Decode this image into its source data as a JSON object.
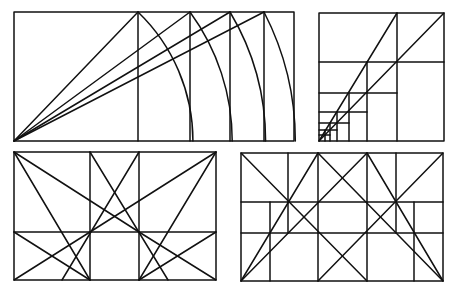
{
  "canvas": {
    "width": 458,
    "height": 285,
    "background": "#ffffff",
    "stroke": "#111111",
    "stroke_width": 1.5
  },
  "panels": [
    {
      "id": "root-rectangles",
      "name": "panel-root-rectangles",
      "frame": {
        "x1": 14,
        "y1": 12,
        "x2": 294,
        "y2": 141
      },
      "lines": [
        [
          138,
          12,
          138,
          141
        ],
        [
          190,
          12,
          190,
          141
        ],
        [
          230,
          12,
          230,
          141
        ],
        [
          264,
          12,
          264,
          141
        ],
        [
          14,
          141,
          138,
          12
        ],
        [
          14,
          141,
          190,
          12
        ],
        [
          14,
          141,
          230,
          12
        ],
        [
          14,
          141,
          264,
          12
        ]
      ],
      "arcs": [
        {
          "cx": 14,
          "cy": 141,
          "from": [
            138,
            12
          ],
          "to": [
            192,
            141
          ]
        },
        {
          "cx": 14,
          "cy": 141,
          "from": [
            190,
            12
          ],
          "to": [
            232,
            141
          ]
        },
        {
          "cx": 14,
          "cy": 141,
          "from": [
            230,
            12
          ],
          "to": [
            265,
            141
          ]
        },
        {
          "cx": 14,
          "cy": 141,
          "from": [
            264,
            12
          ],
          "to": [
            294,
            141
          ]
        }
      ]
    },
    {
      "id": "nested-squares",
      "name": "panel-nested-squares",
      "frame": {
        "x1": 319,
        "y1": 13,
        "x2": 444,
        "y2": 141
      },
      "lines": [
        [
          397,
          13,
          397,
          141
        ],
        [
          319,
          62,
          444,
          62
        ],
        [
          367,
          62,
          367,
          141
        ],
        [
          319,
          93,
          397,
          93
        ],
        [
          349,
          93,
          349,
          141
        ],
        [
          319,
          112,
          367,
          112
        ],
        [
          337,
          112,
          337,
          141
        ],
        [
          319,
          123,
          349,
          123
        ],
        [
          330,
          123,
          330,
          141
        ],
        [
          319,
          130,
          337,
          130
        ],
        [
          325,
          130,
          325,
          141
        ],
        [
          319,
          135,
          330,
          135
        ],
        [
          319,
          141,
          444,
          13
        ],
        [
          319,
          141,
          397,
          13
        ]
      ],
      "arcs": []
    },
    {
      "id": "diagonal-grid-left",
      "name": "panel-diagonal-grid-left",
      "frame": {
        "x1": 14,
        "y1": 152,
        "x2": 216,
        "y2": 280
      },
      "lines": [
        [
          90,
          152,
          90,
          280
        ],
        [
          139,
          152,
          139,
          280
        ],
        [
          14,
          232,
          216,
          232
        ],
        [
          14,
          152,
          139,
          232
        ],
        [
          14,
          152,
          90,
          280
        ],
        [
          216,
          152,
          90,
          232
        ],
        [
          216,
          152,
          139,
          280
        ],
        [
          90,
          152,
          168,
          280
        ],
        [
          139,
          152,
          62,
          280
        ],
        [
          14,
          232,
          90,
          280
        ],
        [
          14,
          280,
          90,
          232
        ],
        [
          216,
          232,
          139,
          280
        ],
        [
          216,
          280,
          139,
          232
        ]
      ],
      "arcs": []
    },
    {
      "id": "diagonal-grid-right",
      "name": "panel-diagonal-grid-right",
      "frame": {
        "x1": 241,
        "y1": 153,
        "x2": 443,
        "y2": 281
      },
      "lines": [
        [
          318,
          153,
          318,
          281
        ],
        [
          367,
          153,
          367,
          281
        ],
        [
          288,
          153,
          288,
          233
        ],
        [
          396,
          153,
          396,
          233
        ],
        [
          241,
          202,
          443,
          202
        ],
        [
          241,
          233,
          443,
          233
        ],
        [
          270,
          202,
          270,
          281
        ],
        [
          414,
          202,
          414,
          281
        ],
        [
          241,
          153,
          367,
          281
        ],
        [
          443,
          153,
          318,
          281
        ],
        [
          241,
          281,
          318,
          153
        ],
        [
          443,
          281,
          367,
          153
        ],
        [
          318,
          153,
          443,
          281
        ],
        [
          367,
          153,
          241,
          281
        ]
      ],
      "arcs": []
    }
  ]
}
